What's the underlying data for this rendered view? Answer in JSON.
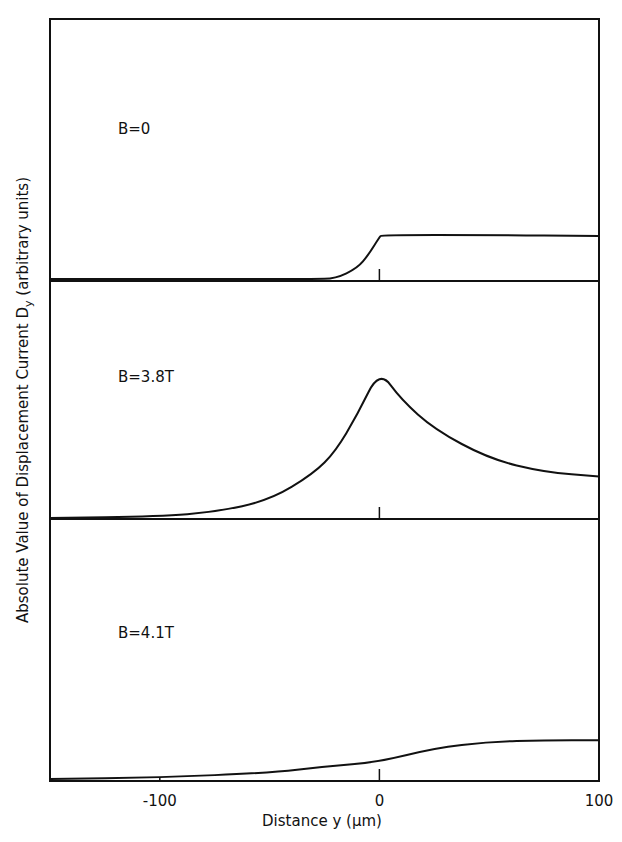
{
  "chart_data": {
    "type": "line",
    "title": "",
    "xlabel": "Distance y (µm)",
    "ylabel": "Absolute Value of Displacement Current D",
    "ylabel_sub": "y",
    "ylabel_units": "(arbitrary units)",
    "xlim": [
      -150,
      100
    ],
    "xticks": [
      "-100",
      "0",
      "100"
    ],
    "grid": false,
    "legend": "none",
    "panels": [
      {
        "label": "B=0",
        "x": [
          -150,
          -100,
          -50,
          -30,
          -20,
          -10,
          -5,
          0,
          1,
          50,
          100
        ],
        "y": [
          0,
          0,
          0,
          0,
          0.003,
          0.1,
          0.22,
          0.38,
          0.4,
          0.4,
          0.39
        ]
      },
      {
        "label": "B=3.8T",
        "x": [
          -150,
          -100,
          -75,
          -50,
          -30,
          -20,
          -10,
          0,
          10,
          25,
          50,
          75,
          100
        ],
        "y": [
          0,
          0.01,
          0.04,
          0.12,
          0.3,
          0.45,
          0.7,
          1.0,
          0.8,
          0.6,
          0.4,
          0.31,
          0.28
        ]
      },
      {
        "label": "B=4.1T",
        "x": [
          -150,
          -100,
          -50,
          -25,
          0,
          25,
          50,
          75,
          100
        ],
        "y": [
          0,
          0.01,
          0.04,
          0.08,
          0.11,
          0.2,
          0.24,
          0.25,
          0.25
        ]
      }
    ]
  }
}
